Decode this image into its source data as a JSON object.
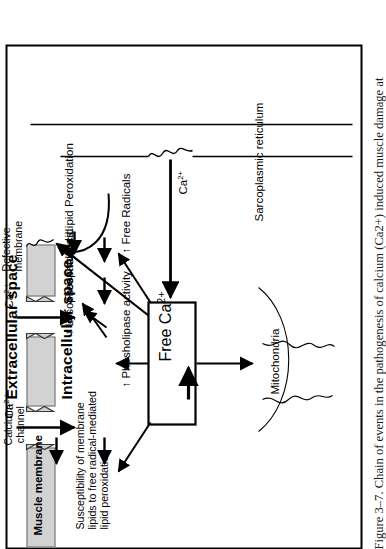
{
  "figure": {
    "caption": "Figure 3–7.  Chain of events in the pathogenesis of calcium (Ca2+) induced muscle damage at",
    "caption_number": "Figure 3–7.",
    "caption_text": "Chain of events in the pathogenesis of calcium (Ca2+) induced muscle damage at"
  },
  "compartments": {
    "extracellular": "Extracellular space",
    "intracellular": "Intracellular space"
  },
  "structures": {
    "muscle_membrane": "Muscle membrane",
    "calcium_channel": "Calcium-\nchannel",
    "defective_membrane": "Defective\nmembrane",
    "sarcoplasmic_reticulum": "Sarcoplasmic reticulum",
    "mitochondria": "Mitochondria"
  },
  "nodes": {
    "free_ca": "Free Ca",
    "free_ca_charge": "2+",
    "ca_extracellular_1": "Ca",
    "ca_extracellular_2": "Ca",
    "ca_sr": "Ca",
    "ca_charge": "2 +",
    "ca_charge_b": "2 +",
    "ca_charge_sr": "2+",
    "susceptibility": "Susceptibility of membrane\nlipids to free radical-mediated\nlipid peroxidation",
    "phospholipase": "↑ Phosholipase activity",
    "lysophospholipids": "↑ Lysophospholipids",
    "free_fatty_acid": "Free fatty acid",
    "free_radicals": "↑ Free Radicals",
    "lipid_peroxidation": "↑ Lipid Peroxidation"
  },
  "colors": {
    "membrane_gray": "#d2d2d2",
    "membrane_stroke": "#6a6a6a",
    "ink": "#000000",
    "page": "#ffffff"
  }
}
